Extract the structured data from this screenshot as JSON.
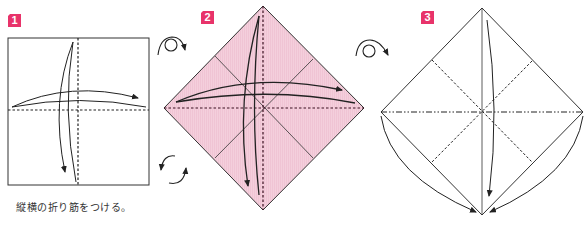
{
  "diagram": {
    "type": "origami-instructions",
    "colors": {
      "badge": "#e8336a",
      "paper_colored": "#f4cfdc",
      "paper_white": "#ffffff",
      "line": "#222222"
    },
    "steps": [
      {
        "number": "1",
        "caption": "縦横の折り筋をつける。",
        "shape": "square",
        "paper": "white",
        "creases": [
          "valley-vertical",
          "valley-horizontal"
        ],
        "arrows": [
          "fold-left-to-right",
          "fold-top-to-bottom"
        ]
      },
      {
        "number": "2",
        "caption": "",
        "shape": "diamond",
        "paper": "colored",
        "creases": [
          "valley-vertical",
          "valley-horizontal",
          "diagonal-creases"
        ],
        "arrows": [
          "fold-left-to-right",
          "fold-top-to-bottom"
        ]
      },
      {
        "number": "3",
        "caption": "",
        "shape": "diamond",
        "paper": "white",
        "creases": [
          "mountain-horizontal",
          "valley-diagonals",
          "vertical-line"
        ],
        "arrows": [
          "fold-top-to-bottom",
          "collapse-left-to-bottom",
          "collapse-right-to-bottom"
        ]
      }
    ],
    "symbols": [
      {
        "name": "turn-over",
        "between": "1-2"
      },
      {
        "name": "rotate",
        "between": "1-2"
      },
      {
        "name": "turn-over",
        "between": "2-3"
      }
    ]
  }
}
